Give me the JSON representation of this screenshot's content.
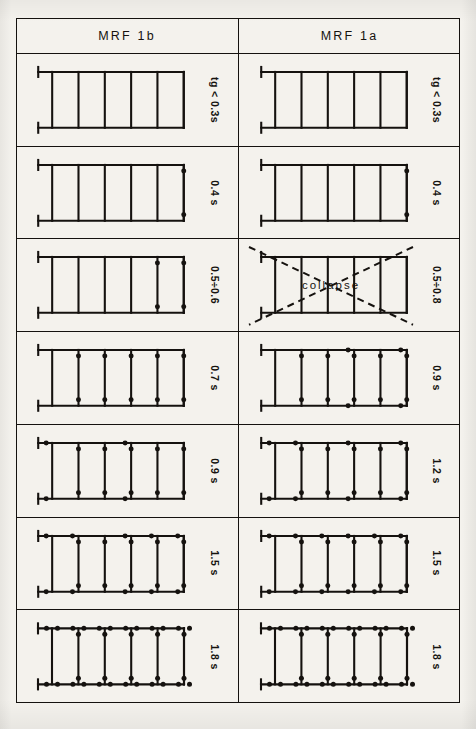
{
  "figure": {
    "columns": [
      {
        "id": "mrf1b",
        "label": "MRF 1b"
      },
      {
        "id": "mrf1a",
        "label": "MRF 1a"
      }
    ],
    "collapse_label": "collapse",
    "line_color": "#15120f",
    "hinge_color": "#15120f",
    "paper_color": "#f4f2ed"
  },
  "rows": [
    {
      "index": 1,
      "left": {
        "time_label": "tg < 0.3s",
        "bays": 5,
        "collapsed": false,
        "column_hinges_top": [],
        "column_hinges_bottom": [],
        "beam_hinges_top": [],
        "beam_hinges_bottom": []
      },
      "right": {
        "time_label": "tg < 0.3s",
        "bays": 5,
        "collapsed": false,
        "column_hinges_top": [],
        "column_hinges_bottom": [],
        "beam_hinges_top": [],
        "beam_hinges_bottom": []
      }
    },
    {
      "index": 2,
      "left": {
        "time_label": "0.4 s",
        "bays": 5,
        "collapsed": false,
        "column_hinges_top": [
          5
        ],
        "column_hinges_bottom": [
          5
        ],
        "beam_hinges_top": [],
        "beam_hinges_bottom": []
      },
      "right": {
        "time_label": "0.4 s",
        "bays": 5,
        "collapsed": false,
        "column_hinges_top": [
          5
        ],
        "column_hinges_bottom": [
          5
        ],
        "beam_hinges_top": [],
        "beam_hinges_bottom": []
      }
    },
    {
      "index": 3,
      "left": {
        "time_label": "0.5÷0.6",
        "bays": 5,
        "collapsed": false,
        "column_hinges_top": [
          4,
          5
        ],
        "column_hinges_bottom": [
          4,
          5
        ],
        "beam_hinges_top": [],
        "beam_hinges_bottom": []
      },
      "right": {
        "time_label": "0.5÷0.8",
        "bays": 5,
        "collapsed": true,
        "column_hinges_top": [],
        "column_hinges_bottom": [],
        "beam_hinges_top": [],
        "beam_hinges_bottom": []
      }
    },
    {
      "index": 4,
      "left": {
        "time_label": "0.7 s",
        "bays": 5,
        "collapsed": false,
        "column_hinges_top": [
          1,
          2,
          3,
          4,
          5
        ],
        "column_hinges_bottom": [
          1,
          2,
          3,
          4,
          5
        ],
        "beam_hinges_top": [],
        "beam_hinges_bottom": []
      },
      "right": {
        "time_label": "0.9 s",
        "bays": 5,
        "collapsed": false,
        "column_hinges_top": [
          1,
          2,
          3,
          4,
          5
        ],
        "column_hinges_bottom": [
          1,
          2,
          3,
          4,
          5
        ],
        "beam_hinges_top": [
          3,
          5
        ],
        "beam_hinges_bottom": [
          3,
          5
        ]
      }
    },
    {
      "index": 5,
      "left": {
        "time_label": "0.9 s",
        "bays": 5,
        "collapsed": false,
        "column_hinges_top": [
          1,
          2,
          3,
          4,
          5
        ],
        "column_hinges_bottom": [
          1,
          2,
          3,
          4,
          5
        ],
        "beam_hinges_top": [
          0,
          3
        ],
        "beam_hinges_bottom": [
          0,
          3
        ]
      },
      "right": {
        "time_label": "1.2 s",
        "bays": 5,
        "collapsed": false,
        "column_hinges_top": [
          1,
          2,
          3,
          4,
          5
        ],
        "column_hinges_bottom": [
          1,
          2,
          3,
          4,
          5
        ],
        "beam_hinges_top": [
          0,
          1,
          3,
          5
        ],
        "beam_hinges_bottom": [
          0,
          1,
          3,
          5
        ]
      }
    },
    {
      "index": 6,
      "left": {
        "time_label": "1.5 s",
        "bays": 5,
        "collapsed": false,
        "column_hinges_top": [
          1,
          2,
          3,
          4,
          5
        ],
        "column_hinges_bottom": [
          1,
          2,
          3,
          4,
          5
        ],
        "beam_hinges_top": [
          0,
          1,
          3,
          4,
          5
        ],
        "beam_hinges_bottom": [
          0,
          1,
          3,
          4,
          5
        ]
      },
      "right": {
        "time_label": "1.5 s",
        "bays": 5,
        "collapsed": false,
        "column_hinges_top": [
          1,
          2,
          3,
          4,
          5
        ],
        "column_hinges_bottom": [
          1,
          2,
          3,
          4,
          5
        ],
        "beam_hinges_top": [
          0,
          1,
          2,
          3,
          4,
          5
        ],
        "beam_hinges_bottom": [
          0,
          1,
          2,
          3,
          4,
          5
        ]
      }
    },
    {
      "index": 7,
      "left": {
        "time_label": "1.8 s",
        "bays": 5,
        "collapsed": false,
        "column_hinges_top": [
          1,
          2,
          3,
          4,
          5
        ],
        "column_hinges_bottom": [
          1,
          2,
          3,
          4,
          5
        ],
        "beam_hinges_top": [
          0,
          1,
          2,
          3,
          4,
          5
        ],
        "beam_hinges_bottom": [
          0,
          1,
          2,
          3,
          4,
          5
        ],
        "beam_hinges_double": true
      },
      "right": {
        "time_label": "1.8 s",
        "bays": 5,
        "collapsed": false,
        "column_hinges_top": [
          1,
          2,
          3,
          4,
          5
        ],
        "column_hinges_bottom": [
          1,
          2,
          3,
          4,
          5
        ],
        "beam_hinges_top": [
          0,
          1,
          2,
          3,
          4,
          5
        ],
        "beam_hinges_bottom": [
          0,
          1,
          2,
          3,
          4,
          5
        ],
        "beam_hinges_double": true
      }
    }
  ]
}
